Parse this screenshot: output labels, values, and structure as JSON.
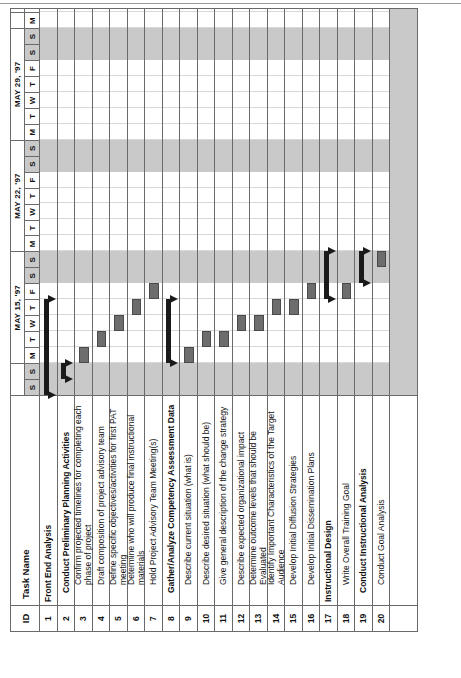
{
  "document": {
    "type": "gantt-chart",
    "orientation": "rotated-90-ccw"
  },
  "columns": {
    "id_header": "ID",
    "task_header": "Task Name"
  },
  "timeline": {
    "weeks": [
      {
        "label": "",
        "days": 2
      },
      {
        "label": "MAY 15, '97",
        "days": 7
      },
      {
        "label": "MAY 22, '97",
        "days": 7
      },
      {
        "label": "MAY 29, '97",
        "days": 7
      },
      {
        "label": "",
        "days": 1
      }
    ],
    "days": [
      {
        "letter": "S",
        "weekend": true
      },
      {
        "letter": "S",
        "weekend": true
      },
      {
        "letter": "M",
        "weekend": false
      },
      {
        "letter": "T",
        "weekend": false
      },
      {
        "letter": "W",
        "weekend": false
      },
      {
        "letter": "T",
        "weekend": false
      },
      {
        "letter": "F",
        "weekend": false
      },
      {
        "letter": "S",
        "weekend": true
      },
      {
        "letter": "S",
        "weekend": true
      },
      {
        "letter": "M",
        "weekend": false
      },
      {
        "letter": "T",
        "weekend": false
      },
      {
        "letter": "W",
        "weekend": false
      },
      {
        "letter": "T",
        "weekend": false
      },
      {
        "letter": "F",
        "weekend": false
      },
      {
        "letter": "S",
        "weekend": true
      },
      {
        "letter": "S",
        "weekend": true
      },
      {
        "letter": "M",
        "weekend": false
      },
      {
        "letter": "T",
        "weekend": false
      },
      {
        "letter": "W",
        "weekend": false
      },
      {
        "letter": "T",
        "weekend": false
      },
      {
        "letter": "F",
        "weekend": false
      },
      {
        "letter": "S",
        "weekend": true
      },
      {
        "letter": "S",
        "weekend": true
      },
      {
        "letter": "M",
        "weekend": false
      }
    ]
  },
  "chart_data": {
    "type": "bar",
    "xlabel": "",
    "ylabel": "",
    "axis_start": "1997-05-10",
    "day_count": 24,
    "tasks": [
      {
        "id": "1",
        "name": "Front End Analysis",
        "level": 1,
        "summary": true,
        "start_day": 0,
        "end_day": 6
      },
      {
        "id": "2",
        "name": "Conduct Preliminary Planning Activities",
        "level": 2,
        "summary": true,
        "start_day": 1,
        "end_day": 2
      },
      {
        "id": "3",
        "name": "Confirm projected timelines for completing each phase of project",
        "level": 3,
        "summary": false,
        "start_day": 2,
        "end_day": 3
      },
      {
        "id": "4",
        "name": "Draft composition of project advisory team",
        "level": 3,
        "summary": false,
        "start_day": 3,
        "end_day": 4
      },
      {
        "id": "5",
        "name": "Define specific objectives/activities for first PAT meeting",
        "level": 3,
        "summary": false,
        "start_day": 4,
        "end_day": 5
      },
      {
        "id": "6",
        "name": "Determine who will produce final instructional materials",
        "level": 3,
        "summary": false,
        "start_day": 5,
        "end_day": 6
      },
      {
        "id": "7",
        "name": "Hold Project Advisory Team Meeting(s)",
        "level": 3,
        "summary": false,
        "start_day": 6,
        "end_day": 7
      },
      {
        "id": "8",
        "name": "Gather/Analyze Competency Assessment Data",
        "level": 2,
        "summary": true,
        "start_day": 2,
        "end_day": 6
      },
      {
        "id": "9",
        "name": "Describe current situation (what is)",
        "level": 3,
        "summary": false,
        "start_day": 2,
        "end_day": 3
      },
      {
        "id": "10",
        "name": "Describe desired situation (what should be)",
        "level": 3,
        "summary": false,
        "start_day": 3,
        "end_day": 4
      },
      {
        "id": "11",
        "name": "Give general description of the change strategy",
        "level": 3,
        "summary": false,
        "start_day": 3,
        "end_day": 4
      },
      {
        "id": "12",
        "name": "Describe expected organizational impact",
        "level": 3,
        "summary": false,
        "start_day": 4,
        "end_day": 5
      },
      {
        "id": "13",
        "name": "Determine outcome levels that should be Evaluated",
        "level": 3,
        "summary": false,
        "start_day": 4,
        "end_day": 5
      },
      {
        "id": "14",
        "name": "Identify Important Characteristics of the Target Audience",
        "level": 3,
        "summary": false,
        "start_day": 5,
        "end_day": 6
      },
      {
        "id": "15",
        "name": "Develop Initial Diffusion Strategies",
        "level": 3,
        "summary": false,
        "start_day": 5,
        "end_day": 6
      },
      {
        "id": "16",
        "name": "Develop Initial Dissemination Plans",
        "level": 3,
        "summary": false,
        "start_day": 6,
        "end_day": 7
      },
      {
        "id": "17",
        "name": "Instructional Design",
        "level": 1,
        "summary": true,
        "start_day": 6,
        "end_day": 9
      },
      {
        "id": "18",
        "name": "Write Overall Training Goal",
        "level": 3,
        "summary": false,
        "start_day": 6,
        "end_day": 7
      },
      {
        "id": "19",
        "name": "Conduct Instructional Analysis",
        "level": 2,
        "summary": true,
        "start_day": 7,
        "end_day": 9
      },
      {
        "id": "20",
        "name": "Conduct Goal Analysis",
        "level": 3,
        "summary": false,
        "start_day": 8,
        "end_day": 9
      }
    ]
  },
  "colors": {
    "bar_fill": "#6d6d6d",
    "bar_stroke": "#4a4a4a",
    "summary_bar": "#1a1a1a",
    "weekend_shade": "#c9c9c9",
    "grid_line": "#6a6a6a"
  }
}
